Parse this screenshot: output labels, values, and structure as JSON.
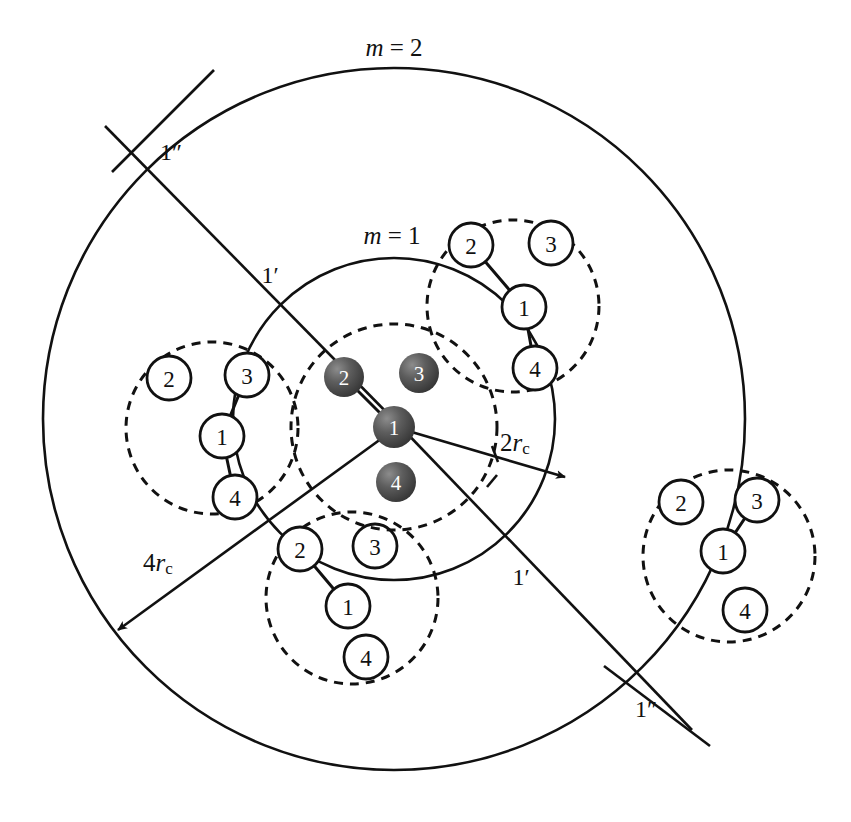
{
  "figure": {
    "title_alt": "Hierarchical cell-cluster diagram with concentric interaction shells",
    "background_color": "#ffffff",
    "stroke_color": "#111111",
    "filled_node_color": "#4a4a4a",
    "open_node_fill": "#ffffff"
  },
  "shells": [
    {
      "id": "shell-m2",
      "label": "m = 2",
      "label_math_italic_part": "m",
      "label_x": 394,
      "label_y": 47,
      "cx": 394,
      "cy": 419,
      "r": 351,
      "style": "solid"
    },
    {
      "id": "shell-m1",
      "label": "m = 1",
      "label_math_italic_part": "m",
      "label_x": 392,
      "label_y": 235,
      "cx": 394,
      "cy": 419,
      "r": 161,
      "style": "solid"
    }
  ],
  "radius_annotations": [
    {
      "id": "radius-2rc",
      "label_main": "2r",
      "label_sub": "c",
      "label_x": 515,
      "label_y": 442,
      "arrow_from": {
        "x": 396,
        "y": 428
      },
      "arrow_to": {
        "x": 567,
        "y": 478
      }
    },
    {
      "id": "radius-4rc",
      "label_main": "4r",
      "label_sub": "c",
      "label_x": 158,
      "label_y": 562,
      "arrow_from": {
        "x": 396,
        "y": 428
      },
      "arrow_to": {
        "x": 113,
        "y": 634
      }
    }
  ],
  "prime_labels": [
    {
      "id": "label-1dprime-topleft",
      "text": "1″",
      "x": 171,
      "y": 152
    },
    {
      "id": "label-1prime-upper",
      "text": "1′",
      "x": 270,
      "y": 275
    },
    {
      "id": "label-1prime-lower",
      "text": "1′",
      "x": 521,
      "y": 577
    },
    {
      "id": "label-1dprime-bottomright",
      "text": "1″",
      "x": 646,
      "y": 709
    }
  ],
  "rays": [
    {
      "id": "ray-upper-left-diagonal",
      "x1": 105,
      "y1": 126,
      "x2": 398,
      "y2": 424,
      "note": "passes through 1-double-prime and 1-prime intersections"
    },
    {
      "id": "ray-lower-right-diagonal",
      "x1": 398,
      "y1": 424,
      "x2": 692,
      "y2": 730,
      "note": "continues through 1-prime and 1-double-prime bottom right"
    },
    {
      "id": "ray-crossing-upper-left",
      "x1": 112,
      "y1": 172,
      "x2": 210,
      "y2": 72,
      "note": "short crossing stroke near 1-double-prime top-left"
    },
    {
      "id": "ray-crossing-bottom-right",
      "x1": 608,
      "y1": 670,
      "x2": 706,
      "y2": 742,
      "note": "short crossing stroke near 1-double-prime bottom-right"
    }
  ],
  "center_cluster": {
    "id": "cluster-center",
    "type": "filled",
    "dashed_circle": {
      "cx": 394,
      "cy": 427,
      "r": 103
    },
    "nodes": [
      {
        "label": "1",
        "x": 394,
        "y": 427,
        "r": 20
      },
      {
        "label": "2",
        "x": 344,
        "y": 377,
        "r": 20
      },
      {
        "label": "3",
        "x": 419,
        "y": 373,
        "r": 20
      },
      {
        "label": "4",
        "x": 396,
        "y": 482,
        "r": 20
      }
    ],
    "bonds": [
      {
        "from": "2",
        "to": "1"
      }
    ]
  },
  "open_clusters": [
    {
      "id": "cluster-top-right",
      "dashed_circle": {
        "cx": 513,
        "cy": 306,
        "r": 86
      },
      "nodes": [
        {
          "label": "2",
          "x": 471,
          "y": 245,
          "r": 22
        },
        {
          "label": "3",
          "x": 551,
          "y": 243,
          "r": 22
        },
        {
          "label": "1",
          "x": 524,
          "y": 307,
          "r": 22
        },
        {
          "label": "4",
          "x": 535,
          "y": 368,
          "r": 22
        }
      ],
      "bonds": [
        {
          "from": "2",
          "to": "1"
        },
        {
          "from": "1",
          "to": "4"
        }
      ]
    },
    {
      "id": "cluster-left",
      "dashed_circle": {
        "cx": 212,
        "cy": 428,
        "r": 86
      },
      "nodes": [
        {
          "label": "2",
          "x": 169,
          "y": 378,
          "r": 22
        },
        {
          "label": "3",
          "x": 247,
          "y": 375,
          "r": 22
        },
        {
          "label": "1",
          "x": 222,
          "y": 436,
          "r": 22
        },
        {
          "label": "4",
          "x": 235,
          "y": 497,
          "r": 22
        }
      ],
      "bonds": [
        {
          "from": "3",
          "to": "1"
        },
        {
          "from": "1",
          "to": "4"
        }
      ]
    },
    {
      "id": "cluster-bottom",
      "dashed_circle": {
        "cx": 352,
        "cy": 598,
        "r": 86
      },
      "nodes": [
        {
          "label": "2",
          "x": 300,
          "y": 549,
          "r": 22
        },
        {
          "label": "3",
          "x": 375,
          "y": 546,
          "r": 22
        },
        {
          "label": "1",
          "x": 348,
          "y": 606,
          "r": 22
        },
        {
          "label": "4",
          "x": 366,
          "y": 657,
          "r": 22
        }
      ],
      "bonds": [
        {
          "from": "2",
          "to": "1"
        }
      ]
    },
    {
      "id": "cluster-right",
      "dashed_circle": {
        "cx": 729,
        "cy": 556,
        "r": 86
      },
      "nodes": [
        {
          "label": "2",
          "x": 681,
          "y": 502,
          "r": 22
        },
        {
          "label": "3",
          "x": 757,
          "y": 500,
          "r": 22
        },
        {
          "label": "1",
          "x": 723,
          "y": 551,
          "r": 22
        },
        {
          "label": "4",
          "x": 745,
          "y": 610,
          "r": 22
        }
      ],
      "bonds": [
        {
          "from": "3",
          "to": "1"
        }
      ]
    }
  ]
}
